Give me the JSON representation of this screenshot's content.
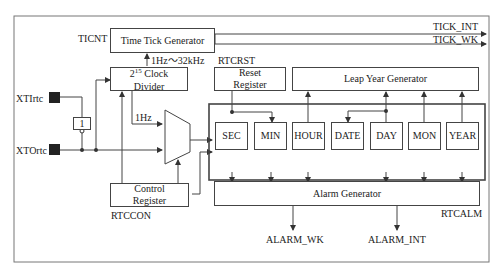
{
  "diagram": {
    "blocks": {
      "time_tick_generator": "Time Tick Generator",
      "clock_divider_base": "2",
      "clock_divider_exp": "15",
      "clock_divider_rest": " Clock",
      "clock_divider_line2": "Divider",
      "reset_register_l1": "Reset",
      "reset_register_l2": "Register",
      "leap_year_generator": "Leap Year Generator",
      "control_register_l1": "Control",
      "control_register_l2": "Register",
      "alarm_generator": "Alarm Generator",
      "inverter": "1"
    },
    "time_registers": [
      "SEC",
      "MIN",
      "HOUR",
      "DATE",
      "DAY",
      "MON",
      "YEAR"
    ],
    "labels": {
      "ticnt": "TICNT",
      "rtcrst": "RTCRST",
      "freq_range": "1Hz～32kHz",
      "one_hz": "1Hz",
      "xtirtc": "XTIrtc",
      "xtortc": "XTOrtc",
      "rtccon": "RTCCON",
      "rtcalm": "RTCALM",
      "tick_int": "TICK_INT",
      "tick_wk": "TICK_WK",
      "alarm_wk": "ALARM_WK",
      "alarm_int": "ALARM_INT"
    }
  }
}
